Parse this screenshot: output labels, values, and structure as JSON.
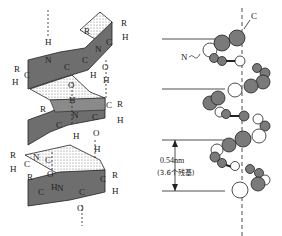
{
  "figure": {
    "left_panel": {
      "description": "alpha-helix ribbon model with backbone atoms",
      "atom_labels": [
        "R",
        "H",
        "C",
        "N",
        "O"
      ],
      "bond_type": "hydrogen bonds (dashed) between C=O and N-H"
    },
    "right_panel": {
      "description": "alpha-helix space-filling ball model",
      "label_c": "C",
      "label_n": "N",
      "pitch_value": "0.54nm",
      "pitch_residues": "(3.6个残基)"
    },
    "colors": {
      "ribbon": "#6e6e6e",
      "atom_dark": "#7a7a7a",
      "atom_light": "#ffffff",
      "line": "#222222"
    }
  }
}
